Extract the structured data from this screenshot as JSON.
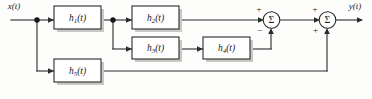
{
  "diagram": {
    "input_label": "x(t)",
    "output_label": "y(t)",
    "sum_glyph": "Σ",
    "colors": {
      "line": "#2b2b2b",
      "background": "#fdfdfc",
      "block_fill": "#ffffff",
      "shadow": "#c8c8c4",
      "text": "#1a1a1a"
    },
    "blocks": [
      {
        "id": "h1",
        "base": "h",
        "subscript": "1",
        "arg": "(t)",
        "label": "h1(t)"
      },
      {
        "id": "h2",
        "base": "h",
        "subscript": "2",
        "arg": "(t)",
        "label": "h2(t)"
      },
      {
        "id": "h3",
        "base": "h",
        "subscript": "3",
        "arg": "(t)",
        "label": "h3(t)"
      },
      {
        "id": "h4",
        "base": "h",
        "subscript": "4",
        "arg": "(t)",
        "label": "h4(t)"
      },
      {
        "id": "h5",
        "base": "h",
        "subscript": "5",
        "arg": "(t)",
        "label": "h5(t)"
      }
    ],
    "summers": [
      {
        "id": "sum1",
        "glyph": "Σ",
        "left_sign": "+",
        "bottom_sign": "−"
      },
      {
        "id": "sum2",
        "glyph": "Σ",
        "left_sign": "+",
        "bottom_sign": "+"
      }
    ],
    "signal_flow": {
      "description": "x(t) splits to h1 and h5; h1 splits to h2 and h3; h3 feeds h4; h2 adds at summer 1, h4 subtracts at summer 1; summer 1 output adds at summer 2 with h5; summer 2 yields y(t)."
    }
  }
}
